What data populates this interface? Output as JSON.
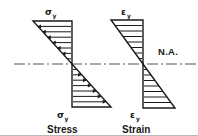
{
  "figure": {
    "colors": {
      "ink": "#1a1a1a",
      "centerline": "#555555",
      "background": "#ffffff",
      "border": "#b9b9b9"
    },
    "neutral_axis": {
      "label": "N.A.",
      "style": "dash-dot",
      "y": 64
    },
    "diagrams": [
      {
        "id": "stress",
        "caption": "Stress",
        "top_label_symbol": "σ",
        "top_label_subscript": "y",
        "bottom_label_symbol": "σ",
        "bottom_label_subscript": "y",
        "hatch_style": "arrows",
        "arrow_direction_top": "left",
        "arrow_direction_bottom": "right",
        "shape": "two-antisymmetric-triangles"
      },
      {
        "id": "strain",
        "caption": "Strain",
        "top_label_symbol": "ε",
        "top_label_subscript": "y",
        "bottom_label_symbol": "ε",
        "bottom_label_subscript": "y",
        "hatch_style": "plain-lines",
        "arrow_direction_top": "none",
        "arrow_direction_bottom": "none",
        "shape": "two-antisymmetric-triangles"
      }
    ]
  }
}
